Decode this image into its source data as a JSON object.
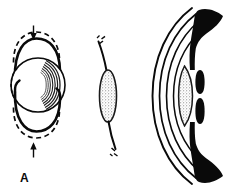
{
  "figure": {
    "panel_label": "A",
    "colors": {
      "ink": "#0a0a0a",
      "background": "#ffffff",
      "stipple": "#8d8d8d",
      "hatch": "#2b2b2b"
    },
    "panels": [
      {
        "name": "lens-capsule-compression-diagram",
        "description": "Spherical lens with capsular arcs above and below, solid and dashed outlines, inward-pointing arrows top and bottom",
        "elements": [
          {
            "name": "arrow-down",
            "direction": "down"
          },
          {
            "name": "dashed-arc-top",
            "style": "dashed"
          },
          {
            "name": "solid-arc-top",
            "style": "solid"
          },
          {
            "name": "lens-sphere",
            "style": "solid-with-concentric-hatching"
          },
          {
            "name": "lens-left-edge",
            "style": "dashed"
          },
          {
            "name": "solid-arc-bottom",
            "style": "solid"
          },
          {
            "name": "dashed-arc-bottom",
            "style": "dashed"
          },
          {
            "name": "arrow-up",
            "direction": "up"
          }
        ]
      },
      {
        "name": "lens-zonule-cross-section",
        "description": "Vertical stippled lens ellipse with zonular fibers extending up-left and down-left, each marked with short break dashes",
        "elements": [
          {
            "name": "zonule-fiber-upper",
            "style": "thin-curve"
          },
          {
            "name": "break-marks-upper",
            "style": "short-dashes"
          },
          {
            "name": "lens-ellipse",
            "style": "stippled"
          },
          {
            "name": "zonule-fiber-lower",
            "style": "thin-curve"
          },
          {
            "name": "break-marks-lower",
            "style": "short-dashes"
          }
        ]
      },
      {
        "name": "anterior-eye-segment",
        "description": "Sagittal section of anterior eye: corneal layers as nested thin curves, solid black ciliary body wedges and iris leaves, stippled lens between them",
        "elements": [
          {
            "name": "cornea-outer-curve",
            "style": "thin-curve"
          },
          {
            "name": "cornea-middle-curve",
            "style": "thin-curve"
          },
          {
            "name": "cornea-inner-curve",
            "style": "thin-curve"
          },
          {
            "name": "anterior-chamber-curve",
            "style": "thin-curve"
          },
          {
            "name": "ciliary-body-superior",
            "style": "solid-black"
          },
          {
            "name": "ciliary-body-inferior",
            "style": "solid-black"
          },
          {
            "name": "iris-leaf-superior",
            "style": "solid-black"
          },
          {
            "name": "iris-leaf-inferior",
            "style": "solid-black"
          },
          {
            "name": "lens-ellipse",
            "style": "stippled"
          }
        ]
      }
    ]
  }
}
